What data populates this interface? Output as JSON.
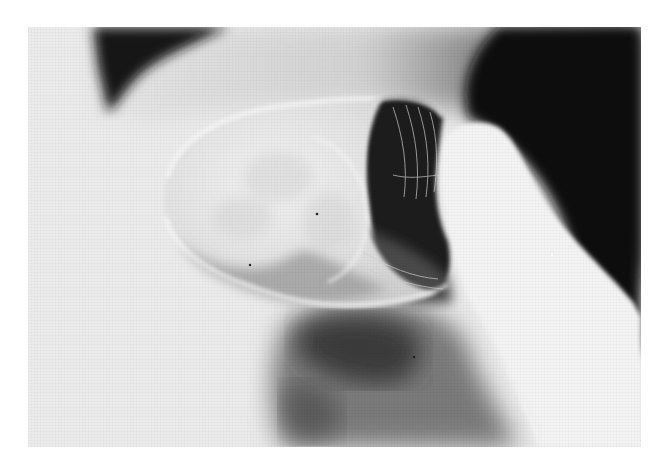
{
  "image": {
    "description": "Grayscale radiographic photograph of a bulbous anatomical structure with fine ridged surface, bright elongated lobe at right, dark background at upper right and dark diffuse mass at bottom center",
    "colors": {
      "margin": "#ffffff",
      "background_light": "#eeeeee",
      "dark_region": "#111111",
      "mid_gray": "#6a6a6a",
      "bright_lobe": "#f4f4f4"
    }
  }
}
